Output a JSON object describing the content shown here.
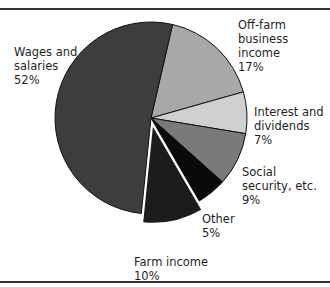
{
  "chart_data": {
    "type": "pie",
    "title": "",
    "slices": [
      {
        "label": "Wages and salaries",
        "value": 52,
        "display": "52%",
        "color": "#3d3d3d",
        "exploded": false
      },
      {
        "label": "Off-farm business income",
        "value": 17,
        "display": "17%",
        "color": "#a8a8a8",
        "exploded": false
      },
      {
        "label": "Interest and dividends",
        "value": 7,
        "display": "7%",
        "color": "#d0d0d0",
        "exploded": false
      },
      {
        "label": "Social security, etc.",
        "value": 9,
        "display": "9%",
        "color": "#7a7a7a",
        "exploded": false
      },
      {
        "label": "Other",
        "value": 5,
        "display": "5%",
        "color": "#0a0a0a",
        "exploded": false
      },
      {
        "label": "Farm income",
        "value": 10,
        "display": "10%",
        "color": "#1c1c1c",
        "exploded": true
      }
    ],
    "legend": "none (direct labels)"
  },
  "labels": {
    "wages": "Wages and\nsalaries\n52%",
    "offfarm": "Off-farm\nbusiness\nincome\n17%",
    "interest": "Interest and\ndividends\n7%",
    "social": "Social\nsecurity, etc.\n9%",
    "other": "Other\n5%",
    "farm": "Farm income\n10%"
  }
}
